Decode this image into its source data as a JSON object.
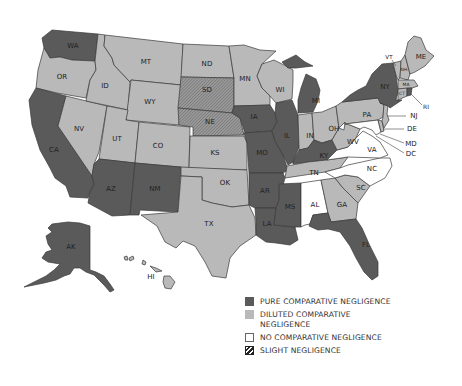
{
  "map": {
    "title": "",
    "categories": {
      "pure": {
        "label": "PURE COMPARATIVE NEGLIGENCE",
        "color": "#5a5a5a"
      },
      "diluted": {
        "label": "DILUTED COMPARATIVE NEGLIGENCE",
        "color": "#b9b9b9"
      },
      "none": {
        "label": "NO COMPARATIVE NEGLIGENCE",
        "color": "#ffffff"
      },
      "slight": {
        "label": "SLIGHT NEGLIGENCE",
        "color": "hatched"
      }
    },
    "states": {
      "WA": "pure",
      "OR": "diluted",
      "CA": "pure",
      "NV": "diluted",
      "ID": "diluted",
      "MT": "diluted",
      "WY": "diluted",
      "UT": "diluted",
      "AZ": "pure",
      "NM": "pure",
      "CO": "diluted",
      "ND": "diluted",
      "SD": "slight",
      "NE": "slight",
      "KS": "diluted",
      "OK": "diluted",
      "TX": "diluted",
      "MN": "diluted",
      "IA": "pure",
      "MO": "pure",
      "AR": "pure",
      "LA": "pure",
      "WI": "diluted",
      "IL": "pure",
      "MI": "pure",
      "IN": "diluted",
      "OH": "diluted",
      "KY": "pure",
      "TN": "diluted",
      "MS": "pure",
      "AL": "none",
      "GA": "diluted",
      "FL": "pure",
      "SC": "diluted",
      "NC": "none",
      "VA": "none",
      "WV": "diluted",
      "MD": "none",
      "DE": "diluted",
      "DC": "none",
      "PA": "diluted",
      "NJ": "diluted",
      "NY": "pure",
      "CT": "diluted",
      "RI": "pure",
      "MA": "diluted",
      "VT": "diluted",
      "NH": "diluted",
      "ME": "diluted",
      "AK": "pure",
      "HI": "diluted"
    },
    "labels": {
      "WA": "WA",
      "OR": "OR",
      "CA": "CA",
      "NV": "NV",
      "ID": "ID",
      "MT": "MT",
      "WY": "WY",
      "UT": "UT",
      "AZ": "AZ",
      "NM": "NM",
      "CO": "CO",
      "ND": "ND",
      "SD": "SD",
      "NE": "NE",
      "KS": "KS",
      "OK": "OK",
      "TX": "TX",
      "MN": "MN",
      "IA": "IA",
      "MO": "MO",
      "AR": "AR",
      "LA": "LA",
      "WI": "WI",
      "IL": "IL",
      "MI": "MI",
      "IN": "IN",
      "OH": "OH",
      "KY": "KY",
      "TN": "TN",
      "MS": "MS",
      "AL": "AL",
      "GA": "GA",
      "FL": "FL",
      "SC": "SC",
      "NC": "NC",
      "VA": "VA",
      "WV": "WV",
      "MD": "MD",
      "DE": "DE",
      "DC": "DC",
      "PA": "PA",
      "NJ": "NJ",
      "NY": "NY",
      "CT": "CT",
      "RI": "RI",
      "MA": "MA",
      "VT": "VT",
      "NH": "NH",
      "ME": "ME",
      "AK": "AK",
      "HI": "HI"
    }
  },
  "legend": {
    "items": [
      {
        "key": "pure",
        "label": "PURE COMPARATIVE NEGLIGENCE"
      },
      {
        "key": "diluted",
        "label": "DILUTED COMPARATIVE NEGLIGENCE"
      },
      {
        "key": "none",
        "label": "NO COMPARATIVE NEGLIGENCE"
      },
      {
        "key": "slight",
        "label": "SLIGHT NEGLIGENCE"
      }
    ]
  }
}
